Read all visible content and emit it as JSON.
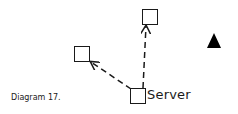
{
  "caption": "Diagram 17.",
  "nodes": {
    "server": {
      "label": "Server",
      "shape": "square"
    },
    "top": {
      "label": "",
      "shape": "square"
    },
    "left": {
      "label": "",
      "shape": "square"
    }
  },
  "marker": {
    "shape": "filled-triangle",
    "color": "#000000"
  },
  "edges": [
    {
      "from": "server",
      "to": "top",
      "style": "dashed",
      "arrow": "end"
    },
    {
      "from": "server",
      "to": "left",
      "style": "dashed",
      "arrow": "end"
    }
  ],
  "colors": {
    "stroke": "#1a1a1a",
    "background": "#ffffff"
  }
}
